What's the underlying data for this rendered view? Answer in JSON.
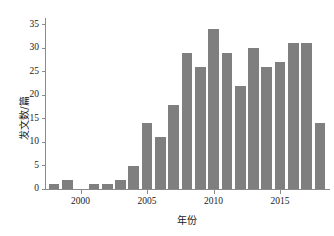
{
  "chart_data": {
    "type": "bar",
    "title": "",
    "xlabel": "年份",
    "ylabel": "发文数/篇",
    "categories": [
      "1998",
      "1999",
      "2000",
      "2001",
      "2002",
      "2003",
      "2004",
      "2005",
      "2006",
      "2007",
      "2008",
      "2009",
      "2010",
      "2011",
      "2012",
      "2013",
      "2014",
      "2015",
      "2016",
      "2017",
      "2018"
    ],
    "values": [
      1,
      2,
      0,
      1,
      1,
      2,
      5,
      14,
      11,
      18,
      29,
      26,
      34,
      29,
      22,
      30,
      26,
      27,
      31,
      31,
      14
    ],
    "series": [
      {
        "name": "发文数",
        "values": [
          1,
          2,
          0,
          1,
          1,
          2,
          5,
          14,
          11,
          18,
          29,
          26,
          34,
          29,
          22,
          30,
          26,
          27,
          31,
          31,
          14
        ]
      }
    ],
    "xlim": [
      1997.4,
      2018.6
    ],
    "ylim": [
      0,
      36
    ],
    "yticks": [
      0,
      5,
      10,
      15,
      20,
      25,
      30,
      35
    ],
    "ytick_labels": [
      "0",
      "5",
      "10",
      "15",
      "20",
      "25",
      "30",
      "35"
    ],
    "xticks": [
      2000,
      2005,
      2010,
      2015
    ],
    "xtick_labels": [
      "2000",
      "2005",
      "2010",
      "2015"
    ],
    "grid": false,
    "legend": null,
    "bar_color": "#7f7f7f",
    "axis_color": "#8a8a8a",
    "text_color": "#1a1a1a",
    "background": "#ffffff"
  }
}
